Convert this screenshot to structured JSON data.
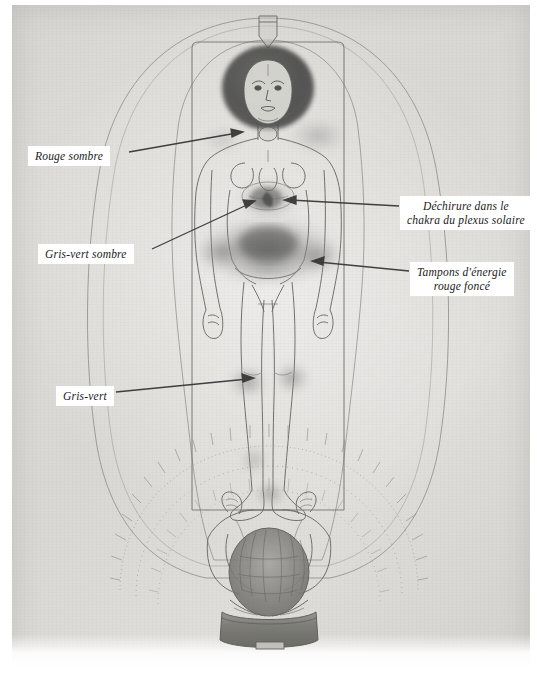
{
  "figure": {
    "kind": "pencil-drawing",
    "title": ""
  },
  "labels": [
    {
      "id": "rouge-sombre",
      "lines": [
        "Rouge sombre"
      ],
      "side": "left",
      "points_at": "upper chest / shoulder aura"
    },
    {
      "id": "gris-vert-sombre",
      "lines": [
        "Gris-vert sombre"
      ],
      "side": "left",
      "points_at": "left side of solar plexus smudge"
    },
    {
      "id": "gris-vert",
      "lines": [
        "Gris-vert"
      ],
      "side": "left",
      "points_at": "left knee / thigh smudge"
    },
    {
      "id": "dechirure",
      "lines": [
        "Déchirure dans le",
        "chakra du plexus solaire"
      ],
      "side": "right",
      "points_at": "solar plexus chakra"
    },
    {
      "id": "tampons",
      "lines": [
        "Tampons d'énergie",
        "rouge foncé"
      ],
      "side": "right",
      "points_at": "lower abdomen / pelvis energy blotches"
    }
  ],
  "colors": {
    "paper": "#dcdad6",
    "ink": "#4a4a4a",
    "arrow": "#1c1c1c",
    "label_bg": "#ffffff",
    "label_text": "#1a1a1a",
    "smudge_dark": "#5d5d5d"
  }
}
